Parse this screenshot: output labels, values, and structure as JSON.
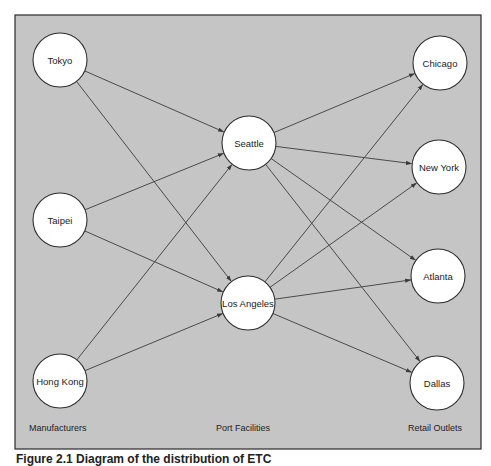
{
  "diagram": {
    "colors": {
      "panel_fill": "#c5c5c5",
      "panel_stroke": "#2a2a2a",
      "node_fill": "#ffffff",
      "edge": "#4a4a4a",
      "text": "#1c1c1c"
    },
    "panel": {
      "x": 15,
      "y": 15,
      "width": 466,
      "height": 434
    },
    "node_radius": 27,
    "nodes": [
      {
        "id": "tokyo",
        "label": "Tokyo",
        "group": "manufacturers",
        "x": 60,
        "y": 60
      },
      {
        "id": "taipei",
        "label": "Taipei",
        "group": "manufacturers",
        "x": 60,
        "y": 220
      },
      {
        "id": "hongkong",
        "label": "Hong Kong",
        "group": "manufacturers",
        "x": 60,
        "y": 381
      },
      {
        "id": "seattle",
        "label": "Seattle",
        "group": "ports",
        "x": 249,
        "y": 143
      },
      {
        "id": "losangeles",
        "label": "Los Angeles",
        "group": "ports",
        "x": 248,
        "y": 303
      },
      {
        "id": "chicago",
        "label": "Chicago",
        "group": "retail",
        "x": 440,
        "y": 63
      },
      {
        "id": "newyork",
        "label": "New York",
        "group": "retail",
        "x": 439,
        "y": 167
      },
      {
        "id": "atlanta",
        "label": "Atlanta",
        "group": "retail",
        "x": 438,
        "y": 276
      },
      {
        "id": "dallas",
        "label": "Dallas",
        "group": "retail",
        "x": 437,
        "y": 383
      }
    ],
    "edges": [
      {
        "from": "tokyo",
        "to": "seattle"
      },
      {
        "from": "tokyo",
        "to": "losangeles"
      },
      {
        "from": "taipei",
        "to": "seattle"
      },
      {
        "from": "taipei",
        "to": "losangeles"
      },
      {
        "from": "hongkong",
        "to": "seattle"
      },
      {
        "from": "hongkong",
        "to": "losangeles"
      },
      {
        "from": "seattle",
        "to": "chicago"
      },
      {
        "from": "seattle",
        "to": "newyork"
      },
      {
        "from": "seattle",
        "to": "atlanta"
      },
      {
        "from": "seattle",
        "to": "dallas"
      },
      {
        "from": "losangeles",
        "to": "chicago"
      },
      {
        "from": "losangeles",
        "to": "newyork"
      },
      {
        "from": "losangeles",
        "to": "atlanta"
      },
      {
        "from": "losangeles",
        "to": "dallas"
      }
    ],
    "group_labels": [
      {
        "id": "manufacturers",
        "label": "Manufacturers",
        "x": 29,
        "y": 431
      },
      {
        "id": "ports",
        "label": "Port Facilities",
        "x": 216,
        "y": 431
      },
      {
        "id": "retail",
        "label": "Retail Outlets",
        "x": 408,
        "y": 431
      }
    ]
  },
  "caption": {
    "text": "Figure 2.1  Diagram of the distribution of ETC"
  }
}
